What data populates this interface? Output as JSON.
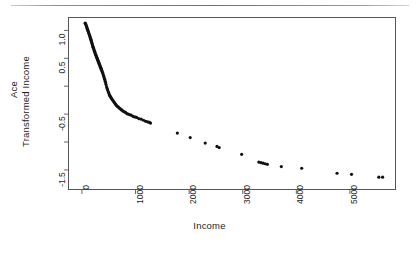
{
  "figure": {
    "background": "#ffffff",
    "ink_color": "#1d1d1d",
    "frame_color": "#555555",
    "point_color": "#111111"
  },
  "axis_titles": {
    "x": "Income",
    "y_line1": "Ace",
    "y_line2": "Transformed Income"
  },
  "chart_data": {
    "type": "scatter",
    "title": "",
    "xlabel": "Income",
    "ylabel": "Ace Transformed Income",
    "xlim": [
      -260,
      5860
    ],
    "ylim": [
      -1.86,
      1.24
    ],
    "xticks": [
      0,
      1000,
      2000,
      3000,
      4000,
      5000
    ],
    "xtick_labels": [
      "0",
      "1000",
      "2000",
      "3000",
      "4000",
      "5000"
    ],
    "yticks": [
      1.0,
      0.5,
      -0.5,
      -1.5
    ],
    "ytick_labels": [
      "1.0",
      "0.5",
      "-0.5",
      "-1.5"
    ],
    "yticks_minor": [
      1.0,
      0.5,
      0.0,
      -0.5,
      -1.0,
      -1.5
    ],
    "grid": false,
    "legend": null,
    "marker": "dot",
    "marker_size": 1.6,
    "series": [
      {
        "name": "ACE transformation of income",
        "x": [
          60,
          68,
          75,
          82,
          90,
          97,
          104,
          111,
          118,
          125,
          132,
          139,
          146,
          153,
          160,
          166,
          172,
          178,
          184,
          190,
          196,
          202,
          208,
          214,
          220,
          226,
          232,
          238,
          244,
          250,
          256,
          262,
          268,
          274,
          280,
          286,
          292,
          298,
          304,
          310,
          316,
          322,
          328,
          334,
          340,
          346,
          352,
          358,
          364,
          370,
          378,
          386,
          394,
          402,
          410,
          418,
          426,
          434,
          442,
          450,
          460,
          470,
          480,
          492,
          504,
          516,
          528,
          540,
          552,
          566,
          580,
          594,
          610,
          626,
          642,
          658,
          676,
          694,
          712,
          730,
          750,
          770,
          792,
          814,
          838,
          862,
          890,
          920,
          952,
          986,
          1020,
          1060,
          1105,
          1150,
          1190,
          1230,
          1260,
          1280,
          1780,
          2020,
          2300,
          2520,
          2560,
          2980,
          3300,
          3340,
          3380,
          3420,
          3460,
          3720,
          4100,
          4760,
          5030,
          5540,
          5610
        ],
        "y": [
          1.13,
          1.12,
          1.1,
          1.08,
          1.06,
          1.04,
          1.02,
          1.0,
          0.98,
          0.96,
          0.94,
          0.92,
          0.9,
          0.88,
          0.86,
          0.84,
          0.82,
          0.8,
          0.78,
          0.76,
          0.74,
          0.72,
          0.7,
          0.69,
          0.67,
          0.65,
          0.63,
          0.62,
          0.6,
          0.58,
          0.57,
          0.55,
          0.54,
          0.52,
          0.51,
          0.49,
          0.48,
          0.46,
          0.45,
          0.43,
          0.42,
          0.4,
          0.39,
          0.37,
          0.36,
          0.34,
          0.33,
          0.31,
          0.3,
          0.28,
          0.26,
          0.24,
          0.22,
          0.19,
          0.17,
          0.14,
          0.12,
          0.09,
          0.06,
          0.03,
          -0.01,
          -0.04,
          -0.07,
          -0.1,
          -0.13,
          -0.16,
          -0.18,
          -0.2,
          -0.22,
          -0.24,
          -0.26,
          -0.28,
          -0.3,
          -0.32,
          -0.34,
          -0.36,
          -0.37,
          -0.39,
          -0.4,
          -0.42,
          -0.43,
          -0.45,
          -0.46,
          -0.47,
          -0.49,
          -0.5,
          -0.51,
          -0.52,
          -0.54,
          -0.55,
          -0.56,
          -0.58,
          -0.59,
          -0.61,
          -0.63,
          -0.64,
          -0.65,
          -0.66,
          -0.84,
          -0.92,
          -1.02,
          -1.08,
          -1.1,
          -1.22,
          -1.36,
          -1.37,
          -1.38,
          -1.39,
          -1.4,
          -1.44,
          -1.47,
          -1.56,
          -1.58,
          -1.63,
          -1.63
        ]
      }
    ]
  }
}
